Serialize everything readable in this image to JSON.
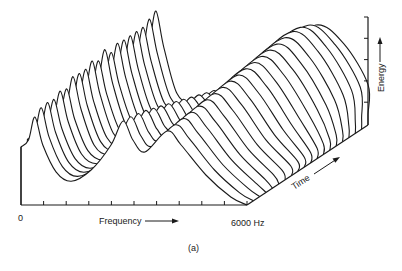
{
  "figure": {
    "caption": "(a)",
    "labels": {
      "origin": "0",
      "frequency": "Frequency",
      "frequency_end": "6000 Hz",
      "time": "Time",
      "energy": "Energy"
    },
    "colors": {
      "line": "#1a1a1a",
      "background": "#ffffff",
      "text": "#222222"
    }
  },
  "chart_data": {
    "type": "waterfall",
    "title": "",
    "caption": "(a)",
    "xlabel": "Frequency",
    "x_range_hz": [
      0,
      6000
    ],
    "x_tick_labels": [
      "0",
      "6000 Hz"
    ],
    "x_tick_count": 10,
    "ylabel": "Energy",
    "y_tick_count": 5,
    "zlabel": "Time",
    "grid": false,
    "legend": null,
    "trace_count": 20,
    "frequency_samples_hz": [
      0,
      200,
      370,
      580,
      930,
      1330,
      1860,
      2390,
      2710,
      2970,
      3290,
      3880,
      4250,
      4910,
      5570,
      6000
    ],
    "front_trace_energy": [
      58,
      65,
      88,
      60,
      35,
      25,
      35,
      60,
      84,
      65,
      53,
      74,
      60,
      30,
      8,
      0
    ],
    "series": [
      {
        "name": "t1",
        "f1_peak": 88,
        "f2_peak": 84,
        "f3_peak": 74
      },
      {
        "name": "t2",
        "f1_peak": 93,
        "f2_peak": 84,
        "f3_peak": 76
      },
      {
        "name": "t3",
        "f1_peak": 94,
        "f2_peak": 83,
        "f3_peak": 78
      },
      {
        "name": "t4",
        "f1_peak": 93,
        "f2_peak": 82,
        "f3_peak": 80
      },
      {
        "name": "t5",
        "f1_peak": 97,
        "f2_peak": 80,
        "f3_peak": 82
      },
      {
        "name": "t6",
        "f1_peak": 95,
        "f2_peak": 78,
        "f3_peak": 84
      },
      {
        "name": "t7",
        "f1_peak": 103,
        "f2_peak": 76,
        "f3_peak": 86
      },
      {
        "name": "t8",
        "f1_peak": 102,
        "f2_peak": 74,
        "f3_peak": 88
      },
      {
        "name": "t9",
        "f1_peak": 102,
        "f2_peak": 72,
        "f3_peak": 90
      },
      {
        "name": "t10",
        "f1_peak": 106,
        "f2_peak": 70,
        "f3_peak": 92
      },
      {
        "name": "t11",
        "f1_peak": 102,
        "f2_peak": 68,
        "f3_peak": 94
      },
      {
        "name": "t12",
        "f1_peak": 109,
        "f2_peak": 66,
        "f3_peak": 96
      },
      {
        "name": "t13",
        "f1_peak": 102,
        "f2_peak": 64,
        "f3_peak": 98
      },
      {
        "name": "t14",
        "f1_peak": 107,
        "f2_peak": 62,
        "f3_peak": 100
      },
      {
        "name": "t15",
        "f1_peak": 106,
        "f2_peak": 60,
        "f3_peak": 102
      },
      {
        "name": "t16",
        "f1_peak": 106,
        "f2_peak": 58,
        "f3_peak": 104
      },
      {
        "name": "t17",
        "f1_peak": 106,
        "f2_peak": 56,
        "f3_peak": 106
      },
      {
        "name": "t18",
        "f1_peak": 106,
        "f2_peak": 54,
        "f3_peak": 106
      },
      {
        "name": "t19",
        "f1_peak": 110,
        "f2_peak": 52,
        "f3_peak": 104
      },
      {
        "name": "t20",
        "f1_peak": 114,
        "f2_peak": 50,
        "f3_peak": 100
      }
    ]
  }
}
